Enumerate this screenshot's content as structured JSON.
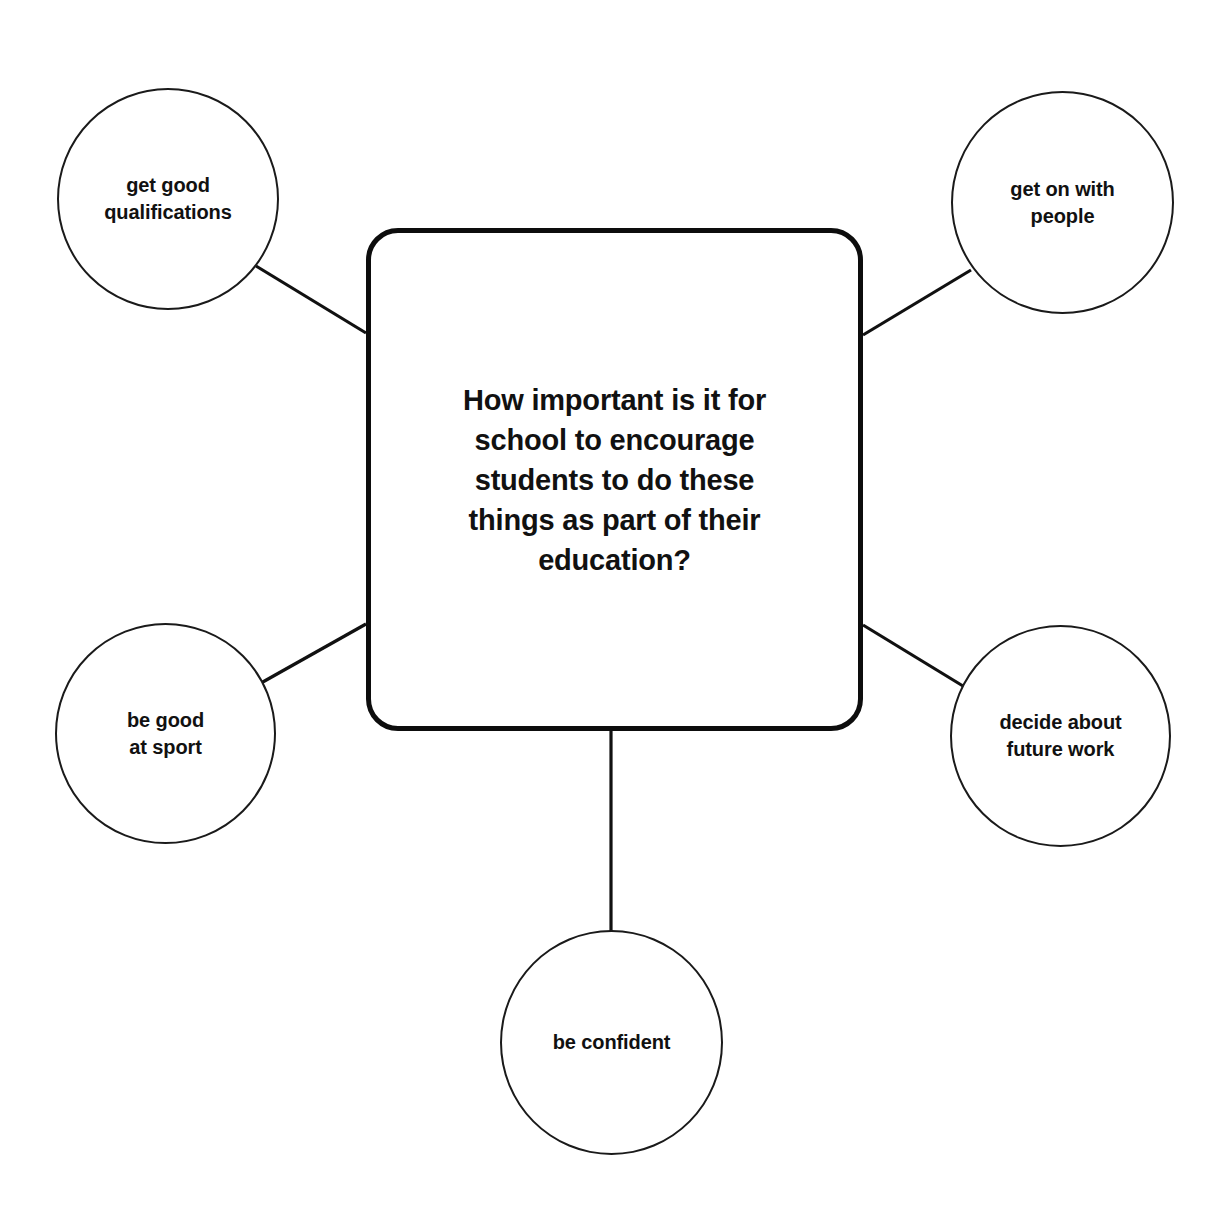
{
  "diagram": {
    "type": "mind-map",
    "background_color": "#ffffff",
    "stroke_color": "#111111",
    "center": {
      "label": "How important is it for\nschool to encourage\nstudents to do these\nthings as part of their\neducation?",
      "shape": "rounded-rectangle"
    },
    "branches": [
      {
        "id": "qualifications",
        "label": "get good\nqualifications",
        "position": "top-left",
        "shape": "circle"
      },
      {
        "id": "people",
        "label": "get on with\npeople",
        "position": "top-right",
        "shape": "circle"
      },
      {
        "id": "sport",
        "label": "be good\nat sport",
        "position": "bottom-left",
        "shape": "circle"
      },
      {
        "id": "futurework",
        "label": "decide about\nfuture work",
        "position": "bottom-right",
        "shape": "circle"
      },
      {
        "id": "confident",
        "label": "be confident",
        "position": "bottom",
        "shape": "circle"
      }
    ]
  }
}
